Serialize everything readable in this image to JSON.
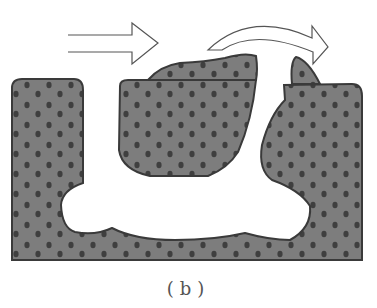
{
  "figure": {
    "caption": "(b)",
    "colors": {
      "rock": "#7d7d7d",
      "outline": "#3a3a3a",
      "grain": "#3f3f3f",
      "void": "#ffffff",
      "arrow_fill": "#ffffff",
      "arrow_stroke": "#555555"
    },
    "elements": {
      "straight_arrow": "flow-direction-arrow",
      "curved_arrow": "detachment-arrow",
      "left_block": "left-porous-block",
      "middle_block": "middle-porous-block",
      "right_block": "right-porous-block",
      "base": "porous-base",
      "channel": "L-shaped-void-channel",
      "cap_middle": "raised-cap-on-middle-block",
      "cap_right": "peeling-fragment-right"
    }
  }
}
